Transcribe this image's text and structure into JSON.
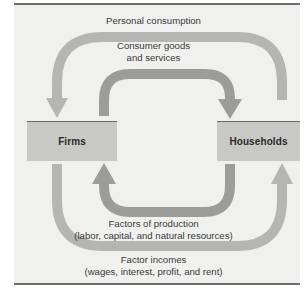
{
  "diagram": {
    "type": "circular-flow",
    "nodes": {
      "firms": {
        "label": "Firms"
      },
      "households": {
        "label": "Households"
      }
    },
    "flows": {
      "outer_top": {
        "label": "Personal consumption",
        "from": "households",
        "to": "firms"
      },
      "inner_top": {
        "label_line1": "Consumer goods",
        "label_line2": "and services",
        "from": "firms",
        "to": "households"
      },
      "inner_bottom": {
        "label_line1": "Factors of production",
        "label_line2": "(labor, capital, and natural resources)",
        "from": "households",
        "to": "firms"
      },
      "outer_bottom": {
        "label_line1": "Factor incomes",
        "label_line2": "(wages, interest, profit, and rent)",
        "from": "firms",
        "to": "households"
      }
    },
    "colors": {
      "outer_arrow": "#b5b5b3",
      "inner_arrow": "#9c9c9a",
      "box_fill": "#c8c8c6",
      "rule": "#6e6e6e",
      "panel": "#f0f0ee"
    }
  }
}
